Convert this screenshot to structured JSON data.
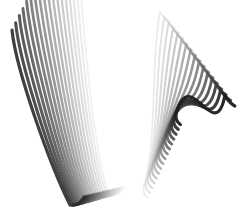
{
  "image": {
    "width": 245,
    "height": 220,
    "background": "#ffffff",
    "description": "Two grayscale clusters of stacked curved strokes forming a V shape"
  },
  "left_cluster": {
    "count": 18,
    "start_top": [
      12,
      30
    ],
    "start_bottom": [
      70,
      205
    ],
    "step": [
      2.6,
      -1.2
    ],
    "curl": 8,
    "dark": "#2a2a2a",
    "light": "#e6e6e6"
  },
  "right_cluster": {
    "count": 16,
    "start_top": [
      160,
      12
    ],
    "start_bottom": [
      148,
      198
    ],
    "step": [
      3.6,
      1.4
    ],
    "curl": 7,
    "dark": "#1e1e1e",
    "light": "#dcdcdc"
  }
}
